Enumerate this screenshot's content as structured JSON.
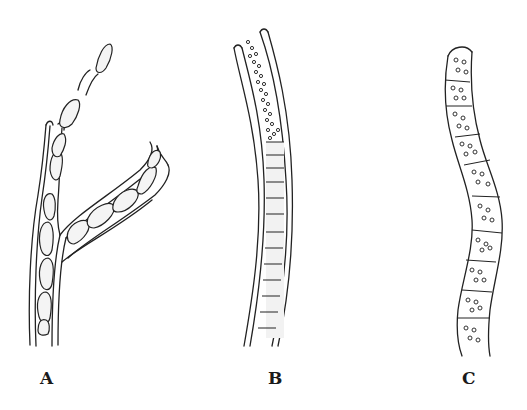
{
  "figure": {
    "panels": [
      {
        "id": "A",
        "label": "A",
        "description": "Branched filament with chain of elongated rounded cells inside a double-walled sheath; a free chain of cells protrudes from the top"
      },
      {
        "id": "B",
        "label": "B",
        "description": "Long curved sheathed filament; upper part filled with granules, lower part with stacked short cylindrical cells"
      },
      {
        "id": "C",
        "label": "C",
        "description": "Wavy segmented filament with cells containing scattered granules"
      }
    ]
  }
}
